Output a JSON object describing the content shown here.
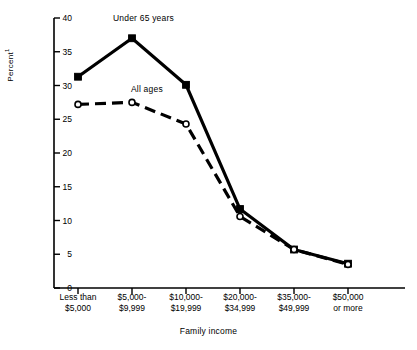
{
  "chart_data": {
    "type": "line",
    "title": "",
    "xlabel": "Family income",
    "ylabel": "Percent",
    "ylabel_superscript": "1",
    "ylim": [
      0,
      40
    ],
    "yticks": [
      0,
      5,
      10,
      15,
      20,
      25,
      30,
      35,
      40
    ],
    "grid": false,
    "legend_position": "inline-annotation",
    "categories": [
      "Less than\n$5,000",
      "$5,000-\n$9,999",
      "$10,000-\n$19,999",
      "$20,000-\n$34,999",
      "$35,000-\n$49,999",
      "$50,000\nor more"
    ],
    "category_lines": [
      [
        "Less than",
        "$5,000"
      ],
      [
        "$5,000-",
        "$9,999"
      ],
      [
        "$10,000-",
        "$19,999"
      ],
      [
        "$20,000-",
        "$34,999"
      ],
      [
        "$35,000-",
        "$49,999"
      ],
      [
        "$50,000",
        "or more"
      ]
    ],
    "series": [
      {
        "name": "Under 65 years",
        "marker": "filled-square",
        "line_style": "solid",
        "color": "#000000",
        "values": [
          31.3,
          37.0,
          30.1,
          11.7,
          5.7,
          3.6
        ]
      },
      {
        "name": "All ages",
        "marker": "open-circle",
        "line_style": "dashed",
        "color": "#000000",
        "values": [
          27.2,
          27.5,
          24.3,
          10.6,
          5.7,
          3.5
        ]
      }
    ],
    "annotations": [
      {
        "text": "Under 65 years",
        "series": "Under 65 years"
      },
      {
        "text": "All ages",
        "series": "All ages"
      }
    ]
  },
  "axis": {
    "y_tick_labels": [
      "40",
      "35",
      "30",
      "25",
      "20",
      "15",
      "10",
      "5",
      "0"
    ],
    "y_title": "Percent",
    "y_title_sup": "1",
    "x_title": "Family income"
  }
}
